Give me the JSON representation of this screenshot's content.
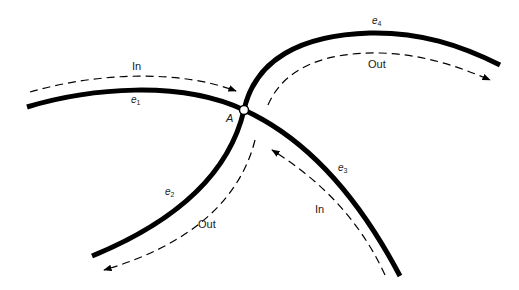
{
  "diagram": {
    "node": {
      "label": "A"
    },
    "edges": [
      {
        "id": "e1",
        "letter": "e",
        "sub": "1"
      },
      {
        "id": "e2",
        "letter": "e",
        "sub": "2"
      },
      {
        "id": "e3",
        "letter": "e",
        "sub": "3"
      },
      {
        "id": "e4",
        "letter": "e",
        "sub": "4"
      }
    ],
    "flows": [
      {
        "edge": "e1",
        "label": "In"
      },
      {
        "edge": "e4",
        "label": "Out"
      },
      {
        "edge": "e2",
        "label": "Out"
      },
      {
        "edge": "e3",
        "label": "In"
      }
    ],
    "colors": {
      "line": "#000000",
      "background": "#ffffff"
    }
  }
}
